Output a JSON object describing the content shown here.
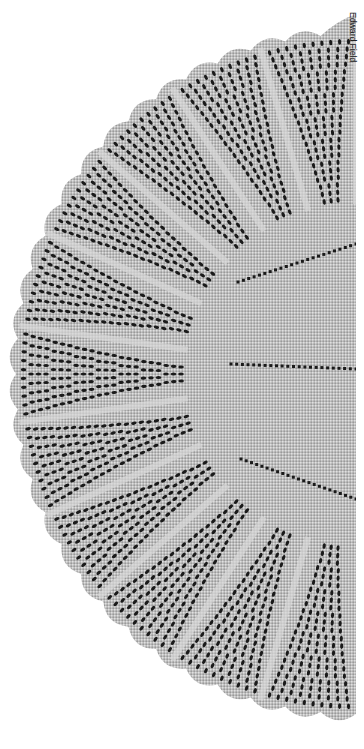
{
  "image": {
    "subject": "knitted lace semicircular shawl",
    "description": "Grayscale photograph of a half-circle knitted lace shawl with a plain central section divided by eyelet lines, surrounded by radiating lace panels and a scalloped outer edge.",
    "palette": {
      "background": "#ffffff",
      "lace_light": "#d8d8d8",
      "lace_mid": "#a8a8a8",
      "eyelet_dark": "#1a1a1a"
    }
  },
  "credit": {
    "text": "Edward Field"
  }
}
